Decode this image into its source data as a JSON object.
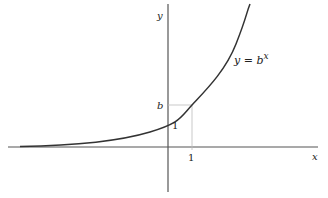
{
  "diagram": {
    "type": "function-graph",
    "function": "exponential",
    "labels": {
      "y_axis": "y",
      "x_axis": "x",
      "curve": "y = b",
      "curve_exp": "x",
      "b_tick": "b",
      "x_tick_one": "1",
      "y_intercept": "1"
    },
    "colors": {
      "axis": "#555555",
      "curve": "#333333",
      "guide": "#bbbbbb"
    }
  }
}
